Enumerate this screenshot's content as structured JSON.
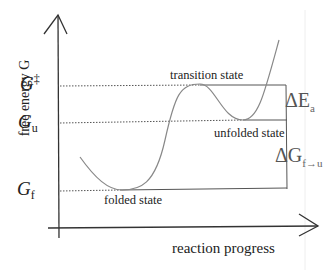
{
  "axes": {
    "y_label": "free energy G",
    "x_label": "reaction progress"
  },
  "levels": {
    "g_ts": {
      "symbol": "G",
      "sup": "‡"
    },
    "g_u": {
      "symbol": "G",
      "sub": "u"
    },
    "g_f": {
      "symbol": "G",
      "sub": "f"
    }
  },
  "states": {
    "transition": "transition state",
    "unfolded": "unfolded state",
    "folded": "folded state"
  },
  "brackets": {
    "activation": {
      "symbol": "ΔE",
      "sub": "a"
    },
    "folding": {
      "symbol": "ΔG",
      "sub": "f→u"
    }
  },
  "colors": {
    "axis": "#333333",
    "curve": "#777777",
    "guide": "#555555"
  }
}
